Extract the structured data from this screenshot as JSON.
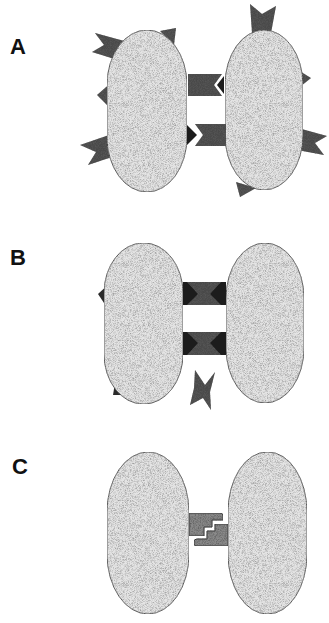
{
  "figure": {
    "panels": [
      {
        "label": "A",
        "description": "Two cells with many surface projections; two interlocking junction pieces between cells"
      },
      {
        "label": "B",
        "description": "Two cells joined by two hourglass junctions; one detached fragment below"
      },
      {
        "label": "C",
        "description": "Two cells joined by a single stepped interlocking junction"
      }
    ],
    "colors": {
      "cell_fill": "#e4e4e4",
      "cell_stipple": "#7a7a7a",
      "cell_outline": "#333333",
      "projection_fill": "#4a4a4a",
      "projection_dark": "#1c1c1c",
      "junction_c_fill": "#8a8a8a",
      "background": "#ffffff",
      "label_color": "#111111"
    }
  }
}
